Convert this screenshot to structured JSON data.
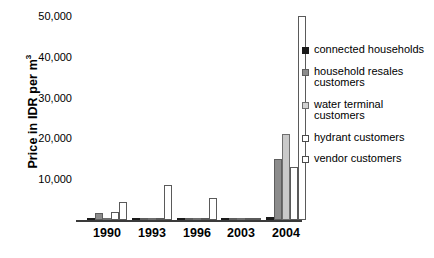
{
  "chart_data": {
    "type": "bar",
    "title": "",
    "subtitle": "",
    "xlabel": "",
    "ylabel": "Price in IDR per m",
    "ylabel_superscript": "3",
    "categories": [
      "1990",
      "1993",
      "1996",
      "2003",
      "2004"
    ],
    "ytick_labels": [
      "10,000",
      "20,000",
      "30,000",
      "40,000",
      "50,000"
    ],
    "ytick_values": [
      10000,
      20000,
      30000,
      40000,
      50000
    ],
    "ylim": [
      0,
      52000
    ],
    "grid": false,
    "legend_position": "right",
    "series": [
      {
        "name": "connected households",
        "color": "#1a1a1a",
        "values": [
          600,
          400,
          400,
          500,
          700
        ]
      },
      {
        "name": "household resales customers",
        "color": "#8c8c8c",
        "values": [
          1800,
          0,
          0,
          0,
          15000
        ]
      },
      {
        "name": "water terminal customers",
        "color": "#c9c9c9",
        "values": [
          0,
          0,
          0,
          0,
          21000
        ]
      },
      {
        "name": "hydrant customers",
        "color": "#ffffff",
        "values": [
          2000,
          0,
          0,
          0,
          13000
        ]
      },
      {
        "name": "vendor customers",
        "color": "#ffffff",
        "values": [
          4500,
          8500,
          5500,
          0,
          50000
        ]
      }
    ]
  },
  "legend": {
    "items": [
      {
        "label": "connected households"
      },
      {
        "label": "household resales customers"
      },
      {
        "label": "water terminal customers"
      },
      {
        "label": "hydrant customers"
      },
      {
        "label": "vendor customers"
      }
    ]
  }
}
